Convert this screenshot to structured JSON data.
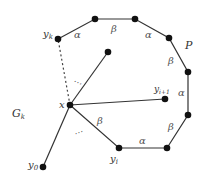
{
  "diagram": {
    "colors": {
      "edge": "#333333",
      "node": "#111111",
      "text": "#333333"
    },
    "nodes": [
      {
        "id": "yk",
        "label": "y",
        "sub": "k",
        "x": 58,
        "y": 39
      },
      {
        "id": "p1",
        "label": "",
        "x": 95,
        "y": 19
      },
      {
        "id": "p2",
        "label": "",
        "x": 135,
        "y": 19
      },
      {
        "id": "p3",
        "label": "",
        "x": 169,
        "y": 38
      },
      {
        "id": "p4",
        "label": "",
        "x": 188,
        "y": 72
      },
      {
        "id": "p5",
        "label": "",
        "x": 188,
        "y": 115
      },
      {
        "id": "p6",
        "label": "",
        "x": 167,
        "y": 148
      },
      {
        "id": "yi",
        "label": "y",
        "sub": "i",
        "x": 119,
        "y": 148
      },
      {
        "id": "x",
        "label": "x",
        "x": 70,
        "y": 105
      },
      {
        "id": "b",
        "label": "",
        "x": 108,
        "y": 52
      },
      {
        "id": "yi1",
        "label": "y",
        "sub": "i+1",
        "x": 165,
        "y": 99
      },
      {
        "id": "y0",
        "label": "y",
        "sub": "0",
        "x": 43,
        "y": 167
      }
    ],
    "polygon_edges": [
      {
        "from": "yk",
        "to": "p1",
        "label": "α"
      },
      {
        "from": "p1",
        "to": "p2",
        "label": "β"
      },
      {
        "from": "p2",
        "to": "p3",
        "label": "α"
      },
      {
        "from": "p3",
        "to": "p4",
        "label": "β"
      },
      {
        "from": "p4",
        "to": "p5",
        "label": "α"
      },
      {
        "from": "p5",
        "to": "p6",
        "label": "β"
      },
      {
        "from": "p6",
        "to": "yi",
        "label": "α"
      },
      {
        "from": "yi",
        "to": "x",
        "label": "β"
      }
    ],
    "star_edges": [
      {
        "from": "x",
        "to": "b"
      },
      {
        "from": "x",
        "to": "yi1"
      },
      {
        "from": "x",
        "to": "y0"
      }
    ],
    "dashed_edges": [
      {
        "from": "x",
        "to": "yk"
      }
    ],
    "labels": {
      "yk": "yk",
      "x": "x",
      "yi1": "yi+1",
      "yi": "yi",
      "y0": "y0",
      "P": "P",
      "Gk": "Gk",
      "ellipsis_upper": "⋯",
      "ellipsis_lower": "⋯"
    },
    "region_labels": {
      "P": "P",
      "G": "G",
      "G_sub": "k"
    }
  }
}
